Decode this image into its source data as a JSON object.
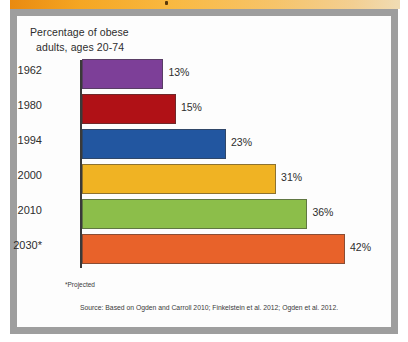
{
  "card": {
    "title_line1": "Percentage of obese",
    "title_line2": "adults, ages 20-74",
    "footnote": "*Projected",
    "source": "Source: Based on Ogden and Carroll 2010; Finkelstein et al. 2012; Ogden et al. 2012."
  },
  "colors": {
    "banner_start": "#e98a10",
    "banner_end": "#f0dcb4",
    "frame": "#9e9e9e",
    "card_background": "#fdfdfd",
    "axis": "#3a3a3a",
    "text": "#2d2d2d"
  },
  "chart_data": {
    "type": "bar",
    "orientation": "horizontal",
    "title": "Percentage of obese adults, ages 20-74",
    "xlabel": "",
    "ylabel": "",
    "xlim": [
      0,
      46
    ],
    "grid": false,
    "legend": "none",
    "categories": [
      "1962",
      "1980",
      "1994",
      "2000",
      "2010",
      "2030*"
    ],
    "values": [
      13,
      15,
      23,
      31,
      36,
      42
    ],
    "value_labels": [
      "13%",
      "15%",
      "23%",
      "31%",
      "36%",
      "42%"
    ],
    "colors": [
      "#7d3f98",
      "#b01116",
      "#2256a0",
      "#f0b323",
      "#8cbe4a",
      "#e8622a"
    ],
    "annotations": [
      "*Projected"
    ],
    "source": "Source: Based on Ogden and Carroll 2010; Finkelstein et al. 2012; Ogden et al. 2012."
  }
}
